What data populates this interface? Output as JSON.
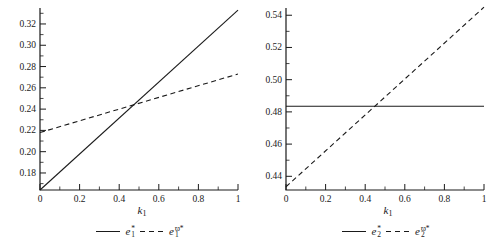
{
  "page": {
    "background": "#ffffff",
    "line_color": "#1a1a1a"
  },
  "chart_data": [
    {
      "type": "line",
      "title": "",
      "xlabel": {
        "base": "k",
        "sub": "1"
      },
      "ylabel": "",
      "grid": false,
      "legend_position": "bottom-center",
      "xlim": [
        0,
        1
      ],
      "ylim": [
        0.164,
        0.335
      ],
      "x_ticks": {
        "values": [
          0,
          0.2,
          0.4,
          0.6,
          0.8,
          1
        ],
        "labels": [
          "0",
          "0.2",
          "0.4",
          "0.6",
          "0.8",
          "1"
        ],
        "minor_step": 0.1
      },
      "y_ticks": {
        "values": [
          0.18,
          0.2,
          0.22,
          0.24,
          0.26,
          0.28,
          0.3,
          0.32
        ],
        "labels": [
          "0.18",
          "0.20",
          "0.22",
          "0.24",
          "0.26",
          "0.28",
          "0.30",
          "0.32"
        ],
        "minor_step": 0.01
      },
      "series": [
        {
          "name": "e1-star",
          "style": "solid",
          "x": [
            0,
            1
          ],
          "y": [
            0.164,
            0.333
          ]
        },
        {
          "name": "e1-pomega-star",
          "style": "dashed",
          "x": [
            0,
            1
          ],
          "y": [
            0.218,
            0.273
          ]
        }
      ],
      "legend": [
        {
          "style": "solid",
          "base": "e",
          "sub": "1",
          "sup": "*"
        },
        {
          "style": "dashed",
          "base": "e",
          "sub": "1",
          "sup": "ϖ*"
        }
      ],
      "intersection": {
        "x": 0.45,
        "y": 0.243
      }
    },
    {
      "type": "line",
      "title": "",
      "xlabel": {
        "base": "k",
        "sub": "1"
      },
      "ylabel": "",
      "grid": false,
      "legend_position": "bottom-center",
      "xlim": [
        0,
        1
      ],
      "ylim": [
        0.4315,
        0.5445
      ],
      "x_ticks": {
        "values": [
          0,
          0.2,
          0.4,
          0.6,
          0.8,
          1
        ],
        "labels": [
          "0",
          "0.2",
          "0.4",
          "0.6",
          "0.8",
          "1"
        ],
        "minor_step": 0.1
      },
      "y_ticks": {
        "values": [
          0.44,
          0.46,
          0.48,
          0.5,
          0.52,
          0.54
        ],
        "labels": [
          "0.44",
          "0.46",
          "0.48",
          "0.50",
          "0.52",
          "0.54"
        ],
        "minor_step": 0.01
      },
      "series": [
        {
          "name": "e2-star",
          "style": "solid",
          "x": [
            0,
            1
          ],
          "y": [
            0.4835,
            0.4835
          ]
        },
        {
          "name": "e2-pomega-star",
          "style": "dashed",
          "x": [
            0,
            1
          ],
          "y": [
            0.4335,
            0.545
          ]
        }
      ],
      "legend": [
        {
          "style": "solid",
          "base": "e",
          "sub": "2",
          "sup": "*"
        },
        {
          "style": "dashed",
          "base": "e",
          "sub": "2",
          "sup": "ϖ*"
        }
      ],
      "intersection": {
        "x": 0.45,
        "y": 0.4835
      }
    }
  ]
}
